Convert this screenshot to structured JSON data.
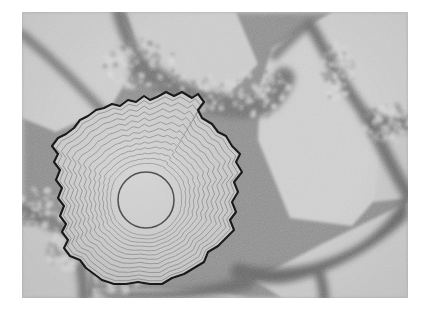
{
  "figure": {
    "kind": "electron-micrograph",
    "canvas": {
      "width": 424,
      "height": 313,
      "background": "#ffffff"
    },
    "image_area": {
      "x": 22,
      "y": 12,
      "width": 386,
      "height": 286
    }
  },
  "palette": {
    "page_background": "#ffffff",
    "grain_light": "#c9c9c9",
    "grain_light_alt": "#cdcdcd",
    "grain_mid": "#b4b4b4",
    "boundary_dark": "#6f6f6f",
    "boundary_darkest": "#5a5a5a",
    "speckle_light": "#d8d8d8",
    "outline_black": "#17181a",
    "contour_line": "#7b7c7e",
    "inner_circle_line": "#4a4b4d"
  },
  "regions": [
    {
      "name": "upper-left-grain",
      "label": "Upper left light grain",
      "fill": "#cbcbcb",
      "points": "0,0 96,0 120,44 88,96 34,120 0,106"
    },
    {
      "name": "upper-middle-grain",
      "label": "Upper middle light grain",
      "fill": "#cacaca",
      "points": "104,0 214,0 236,52 200,90 150,84 118,46"
    },
    {
      "name": "right-large-grain",
      "label": "Large right facetted grain",
      "fill": "#cdcdcd",
      "points": "250,36 310,0 386,0 386,16 386,150 330,214 268,206 236,128 238,74"
    },
    {
      "name": "lower-right-grain",
      "label": "Lower right light grain",
      "fill": "#cacaca",
      "points": "300,232 386,190 386,286 260,286 232,268"
    },
    {
      "name": "lower-left-grain",
      "label": "Lower left light grain",
      "fill": "#c8c8c8",
      "points": "0,214 44,212 70,246 64,286 0,286"
    },
    {
      "name": "bottom-middle-grain",
      "label": "Bottom middle light grain",
      "fill": "#c9c9c9",
      "points": "70,276 190,278 226,286 72,286"
    },
    {
      "name": "far-right-edge-grain",
      "label": "Far right edge grain",
      "fill": "#c7c7c7",
      "points": "360,120 386,104 386,186 352,190"
    }
  ],
  "boundaries": [
    {
      "name": "boundary-upper-left-diagonal",
      "label": "Upper left diagonal grain boundary",
      "color": "#7a7a7a",
      "width": 9,
      "path": "M 0,22 C 34,50 66,82 96,116"
    },
    {
      "name": "boundary-upper-middle-vee",
      "label": "Upper middle branching boundary",
      "color": "#747474",
      "width": 12,
      "path": "M 96,0 C 104,26 112,44 128,58 C 148,76 170,86 196,86"
    },
    {
      "name": "boundary-upper-band",
      "label": "Upper speckled boundary band",
      "color": "#767676",
      "width": 22,
      "path": "M 118,54 C 150,80 182,94 222,96 C 244,96 254,86 262,66"
    },
    {
      "name": "boundary-top-apex-left",
      "label": "Top apex left limb",
      "color": "#787878",
      "width": 9,
      "path": "M 252,44 C 262,34 272,24 284,14"
    },
    {
      "name": "boundary-top-apex-right",
      "label": "Top apex right limb",
      "color": "#6f6f6f",
      "width": 11,
      "path": "M 288,12 C 304,42 322,74 344,104"
    },
    {
      "name": "boundary-right-upper",
      "label": "Right upper boundary toward edge",
      "color": "#6e6e6e",
      "width": 14,
      "path": "M 344,104 C 358,112 372,114 386,112"
    },
    {
      "name": "boundary-right-lower",
      "label": "Right lower boundary toward edge",
      "color": "#707070",
      "width": 13,
      "path": "M 348,110 C 360,134 372,160 386,182"
    },
    {
      "name": "boundary-bottom-right-wedge",
      "label": "Bottom right broad dark wedge",
      "color": "#6b6b6b",
      "width": 2,
      "path": "M 214,250 C 250,262 292,256 330,236 C 356,222 372,202 386,178 L 386,206 C 360,232 322,254 284,266 C 254,276 228,272 206,262 Z"
    },
    {
      "name": "boundary-bottom-spur",
      "label": "Bottom spur under wedge",
      "color": "#6d6d6d",
      "width": 10,
      "path": "M 296,258 C 300,268 302,276 302,286"
    },
    {
      "name": "boundary-left-lower",
      "label": "Left lower boundary",
      "color": "#767676",
      "width": 12,
      "path": "M 0,196 C 16,206 30,214 44,218"
    },
    {
      "name": "boundary-left-vertical",
      "label": "Left vertical boundary below grain",
      "color": "#757575",
      "width": 11,
      "path": "M 52,226 C 58,246 62,266 62,286"
    },
    {
      "name": "boundary-bottom-left-shadow",
      "label": "Bottom shadow under annotated grain",
      "color": "#6e6e6e",
      "width": 2,
      "path": "M 70,276 C 110,282 160,280 206,268 C 216,266 222,262 226,258 L 232,276 C 200,286 140,288 86,286 Z"
    }
  ],
  "speckle_clusters": [
    {
      "name": "speckle-upper-left",
      "cx": 118,
      "cy": 52,
      "rx": 36,
      "ry": 26,
      "color": "#8c8c8c"
    },
    {
      "name": "speckle-upper-middle",
      "cx": 176,
      "cy": 82,
      "rx": 44,
      "ry": 20,
      "color": "#8a8a8a"
    },
    {
      "name": "speckle-upper-right",
      "cx": 238,
      "cy": 80,
      "rx": 30,
      "ry": 24,
      "color": "#878787"
    },
    {
      "name": "speckle-top-right-limb",
      "cx": 316,
      "cy": 60,
      "rx": 16,
      "ry": 30,
      "color": "#8b8b8b"
    },
    {
      "name": "speckle-right-edge",
      "cx": 366,
      "cy": 112,
      "rx": 24,
      "ry": 20,
      "color": "#8a8a8a"
    },
    {
      "name": "speckle-left-mid",
      "cx": 20,
      "cy": 196,
      "rx": 26,
      "ry": 20,
      "color": "#8e8e8e"
    },
    {
      "name": "speckle-left-low",
      "cx": 44,
      "cy": 236,
      "rx": 20,
      "ry": 22,
      "color": "#8d8d8d"
    },
    {
      "name": "speckle-bottom-left",
      "cx": 96,
      "cy": 268,
      "rx": 22,
      "ry": 14,
      "color": "#8c8c8c"
    }
  ],
  "annotated_grain": {
    "name": "annotated-grain",
    "label": "Annotated grain with concentric contour overlay",
    "outline_color": "#17181a",
    "outline_width": 2.1,
    "fill": "#c6c6c6",
    "outline_points": "135,85 144,80 152,84 160,80 170,86 176,82 182,90 176,98 180,106 190,112 196,120 204,124 210,134 218,142 214,150 220,160 212,170 216,180 210,190 214,200 208,208 212,218 204,226 196,234 186,240 182,250 172,256 162,262 150,266 140,272 128,272 116,270 104,272 92,272 80,268 72,262 64,256 58,248 48,244 42,236 46,228 40,220 44,212 38,204 42,194 36,186 40,176 34,168 38,158 32,150 36,142 30,134 36,126 44,122 52,116 58,108 66,104 74,98 82,96 90,92 98,94 106,88 114,90 122,84 128,88",
    "contour_rings": {
      "count": 12,
      "line_color": "#7c7d7f",
      "line_width": 0.85,
      "description": "Twelve nested contour rings interpolating from the faceted outer outline toward the central circle"
    },
    "inner_circle": {
      "name": "inner-circle",
      "cx": 124,
      "cy": 188,
      "r": 28,
      "stroke": "#4a4b4d",
      "stroke_width": 1.6,
      "fill": "none"
    },
    "centroid": {
      "cx": 124,
      "cy": 188
    }
  },
  "noise": {
    "type": "film-grain",
    "base_frequency": 0.92,
    "octaves": 3,
    "opacity": 0.55,
    "description": "Fine high-frequency grain simulating micrograph detector noise"
  }
}
